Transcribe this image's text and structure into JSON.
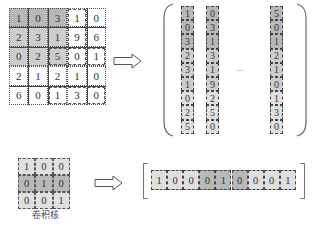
{
  "input_matrix": {
    "rows": [
      [
        1,
        0,
        3,
        1,
        0
      ],
      [
        2,
        3,
        1,
        9,
        6
      ],
      [
        0,
        2,
        5,
        0,
        1
      ],
      [
        2,
        1,
        2,
        1,
        0
      ],
      [
        6,
        0,
        1,
        3,
        0
      ]
    ],
    "highlight": {
      "rows": [
        0,
        2
      ],
      "cols": [
        0,
        2
      ]
    }
  },
  "im2col_columns": [
    {
      "values": [
        1,
        0,
        3,
        2,
        3,
        1,
        0,
        2,
        5
      ]
    },
    {
      "values": [
        0,
        3,
        1,
        3,
        1,
        9,
        2,
        5,
        0
      ]
    },
    {
      "values": [
        5,
        0,
        1,
        2,
        1,
        0,
        1,
        3,
        0
      ]
    }
  ],
  "ellipsis": "...",
  "kernel": {
    "rows": [
      [
        1,
        0,
        0
      ],
      [
        0,
        1,
        0
      ],
      [
        0,
        0,
        1
      ]
    ],
    "label": "卷积核"
  },
  "kernel_row_vector": {
    "values": [
      1,
      0,
      0,
      0,
      1,
      0,
      0,
      0,
      1
    ]
  },
  "colors": {
    "shade_dark": "#b8b8b8",
    "shade_mid": "#cdcdcd",
    "shade_light": "#e0e0e0",
    "line": "#444444"
  }
}
